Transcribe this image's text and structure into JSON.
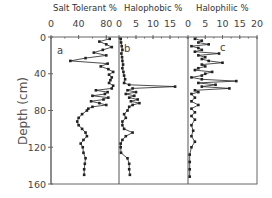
{
  "chart_data": {
    "type": "line",
    "orientation": "depth-profile",
    "ylabel": "Depth (cm)",
    "ylim": [
      0,
      160
    ],
    "yticks": [
      0,
      40,
      80,
      120,
      160
    ],
    "panels": [
      {
        "letter": "a",
        "title": "Salt Tolerant %",
        "xlim": [
          0,
          97
        ],
        "xticks": [
          0,
          40,
          80
        ],
        "depth": [
          2,
          5,
          8,
          11,
          14,
          17,
          20,
          23,
          26,
          29,
          32,
          35,
          38,
          41,
          44,
          47,
          50,
          53,
          56,
          58,
          60,
          62,
          64,
          66,
          68,
          70,
          72,
          74,
          76,
          78,
          80,
          84,
          88,
          92,
          96,
          100,
          104,
          108,
          112,
          116,
          120,
          126,
          132,
          138,
          144,
          150
        ],
        "values": [
          85,
          70,
          80,
          88,
          75,
          62,
          80,
          50,
          28,
          82,
          72,
          83,
          90,
          84,
          88,
          86,
          84,
          90,
          88,
          65,
          82,
          78,
          60,
          83,
          76,
          58,
          70,
          80,
          60,
          54,
          52,
          45,
          40,
          38,
          40,
          45,
          50,
          52,
          47,
          43,
          46,
          47,
          50,
          49,
          48,
          48
        ]
      },
      {
        "letter": "b",
        "title": "Halophobic %",
        "xlim": [
          0,
          20
        ],
        "xticks": [
          0,
          5,
          10,
          15
        ],
        "depth": [
          2,
          6,
          10,
          14,
          18,
          22,
          26,
          30,
          34,
          38,
          42,
          46,
          50,
          52,
          54,
          56,
          58,
          60,
          62,
          64,
          66,
          68,
          70,
          72,
          74,
          76,
          80,
          84,
          88,
          92,
          96,
          100,
          104,
          108,
          112,
          116,
          120,
          126,
          132,
          138,
          144,
          150
        ],
        "values": [
          0.5,
          0.6,
          0.8,
          1.0,
          0.7,
          0.9,
          1.0,
          1.2,
          1.0,
          1.3,
          1.5,
          1.8,
          1.5,
          3.0,
          16.5,
          4.0,
          2.5,
          5.0,
          2.0,
          4.5,
          3.0,
          5.5,
          3.5,
          6.0,
          4.0,
          3.0,
          2.5,
          1.5,
          2.0,
          1.0,
          1.0,
          1.5,
          4.0,
          2.0,
          1.0,
          0.5,
          0.5,
          0.6,
          2.5,
          3.0,
          3.0,
          3.2
        ]
      },
      {
        "letter": "c",
        "title": "Halophilic %",
        "xlim": [
          0,
          20
        ],
        "xticks": [
          0,
          5,
          10,
          15,
          20
        ],
        "depth": [
          2,
          4,
          6,
          8,
          10,
          12,
          14,
          16,
          18,
          20,
          22,
          24,
          26,
          28,
          30,
          32,
          34,
          36,
          38,
          40,
          42,
          44,
          46,
          48,
          50,
          52,
          54,
          56,
          58,
          60,
          62,
          66,
          70,
          74,
          78,
          82,
          86,
          90,
          96,
          102,
          108,
          114,
          120,
          128,
          136,
          144,
          152
        ],
        "values": [
          2,
          4,
          3,
          6,
          1,
          3,
          4,
          2,
          9,
          3,
          5,
          4,
          6,
          10,
          4,
          5,
          3,
          2,
          7,
          5,
          4,
          1,
          4,
          14,
          3,
          8,
          4,
          12,
          2,
          3,
          1,
          2,
          1,
          3,
          1,
          2,
          1,
          2,
          1,
          1.5,
          1,
          2,
          1,
          0.5,
          0.5,
          0.5,
          0.5
        ]
      }
    ]
  },
  "labels": {
    "panel_a_title": "Salt Tolerant %",
    "panel_b_title": "Halophobic %",
    "panel_c_title": "Halophilic %",
    "y_axis": "Depth (cm)",
    "panel_a_letter": "a",
    "panel_b_letter": "b",
    "panel_c_letter": "c",
    "a_ticks": [
      "0",
      "40",
      "80"
    ],
    "b_ticks": [
      "0",
      "5",
      "10",
      "15"
    ],
    "c_ticks": [
      "0",
      "5",
      "10",
      "15",
      "20"
    ],
    "y_ticks": [
      "0",
      "40",
      "80",
      "120",
      "160"
    ]
  },
  "colors": {
    "line": "#222222",
    "axis": "#666666",
    "text": "#444444"
  }
}
